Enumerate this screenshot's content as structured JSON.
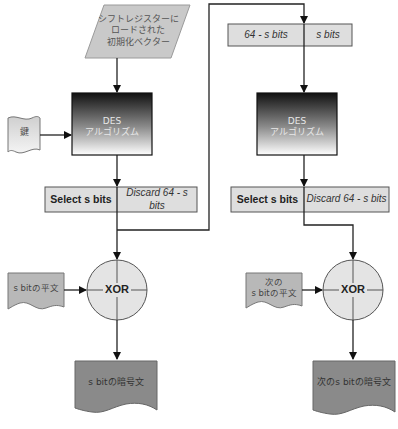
{
  "diagram": {
    "type": "flowchart",
    "colors": {
      "light_fill": "#d8d8d8",
      "bar_fill": "#dedede",
      "circle_fill": "#e4e4e4",
      "cipher_fill": "#8a8a8a",
      "des_gradient_top": "#1a1a1a",
      "des_gradient_bottom": "#ffffff",
      "line": "#222222"
    },
    "iv": {
      "label": "シフトレジスターに\nロードされた\n初期化ベクター"
    },
    "key": {
      "label": "鍵"
    },
    "stage1": {
      "des": {
        "line1": "DES",
        "line2": "アルゴリズム"
      },
      "select": {
        "left": "Select s bits",
        "right": "Discard 64 - s bits"
      },
      "plaintext": {
        "label": "s bitの平文"
      },
      "xor": {
        "label": "XOR"
      },
      "ciphertext": {
        "label": "s bitの暗号文"
      }
    },
    "stage2": {
      "shift_register": {
        "left": "64 - s bits",
        "right": "s bits"
      },
      "des": {
        "line1": "DES",
        "line2": "アルゴリズム"
      },
      "select": {
        "left": "Select s bits",
        "right": "Discard 64 - s bits"
      },
      "plaintext": {
        "label": "次の\ns bitの平文"
      },
      "xor": {
        "label": "XOR"
      },
      "ciphertext": {
        "label": "次のs bitの暗号文"
      }
    }
  }
}
